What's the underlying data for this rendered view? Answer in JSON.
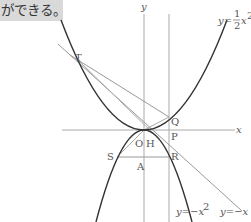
{
  "caption": {
    "text": "ができる。"
  },
  "diagram": {
    "axes": {
      "x_label": "x",
      "y_label": "y"
    },
    "curves": [
      {
        "name": "upper-parabola",
        "equation": "y=½x²",
        "label_prefix": "y=",
        "num": "1",
        "den": "2",
        "suffix": "x",
        "exp": "2"
      },
      {
        "name": "lower-parabola",
        "equation": "y=−x²",
        "label": "y=−x²",
        "label_main": "y=−x",
        "exp": "2"
      },
      {
        "name": "line",
        "equation": "y=−x",
        "label": "y=−x"
      }
    ],
    "points": {
      "T": "T",
      "Q": "Q",
      "P": "P",
      "O": "O",
      "H": "H",
      "S": "S",
      "A": "A",
      "R": "R"
    },
    "colors": {
      "axis": "#aaaaaa",
      "curve": "#333333",
      "line": "#999999",
      "label": "#555555"
    }
  }
}
